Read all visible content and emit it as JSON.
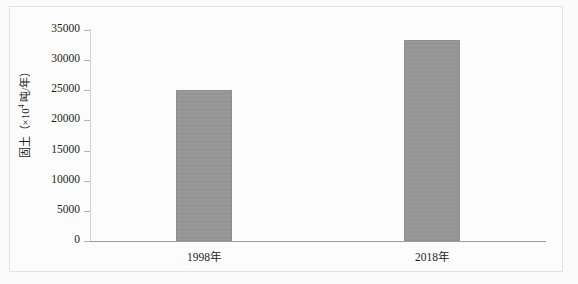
{
  "figure": {
    "background_color": "#fbfbfb",
    "border_color": "#e3e3e3"
  },
  "chart_data": {
    "type": "bar",
    "title": "",
    "subtitle": "",
    "xlabel": "",
    "ylabel": "固土（×10⁴ 吨/年）",
    "ylabel_prefix": "固土（×10",
    "ylabel_exponent": "4",
    "ylabel_suffix": " 吨/年）",
    "categories": [
      "1998年",
      "2018年"
    ],
    "values": [
      25000,
      33300
    ],
    "series": [
      {
        "name": "固土量",
        "values": [
          25000,
          33300
        ]
      }
    ],
    "ylim": [
      0,
      35000
    ],
    "yticks": [
      0,
      5000,
      10000,
      15000,
      20000,
      25000,
      30000,
      35000
    ],
    "ytick_labels": [
      "0",
      "5000",
      "10000",
      "15000",
      "20000",
      "25000",
      "30000",
      "35000"
    ],
    "grid": false,
    "legend": false,
    "legend_position": "none",
    "bar_color": "#969696",
    "bar_edge_color": "#8e8e8e",
    "axis_color": "#9c9c9c",
    "text_color": "#1d1d1d"
  }
}
